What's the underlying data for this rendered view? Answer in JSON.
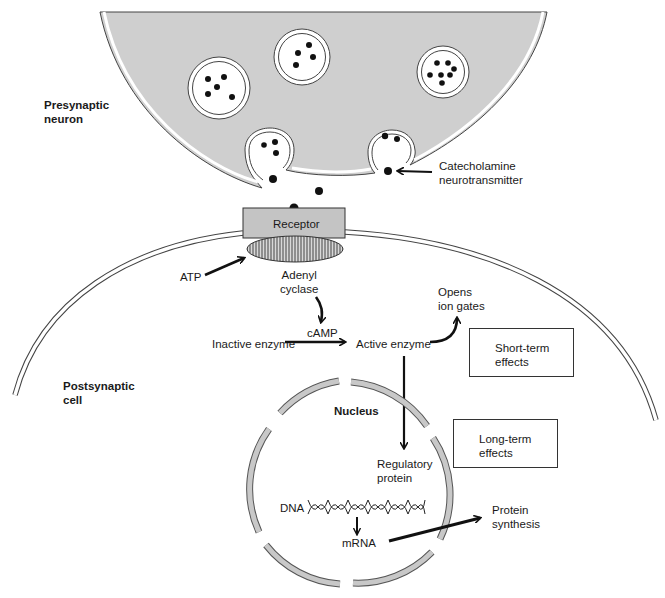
{
  "diagram": {
    "labels": {
      "presynaptic": [
        "Presynaptic",
        "neuron"
      ],
      "postsynaptic": [
        "Postsynaptic",
        "cell"
      ],
      "neurotransmitter": [
        "Catecholamine",
        "neurotransmitter"
      ],
      "receptor": "Receptor",
      "atp": "ATP",
      "adenyl_cyclase": [
        "Adenyl",
        "cyclase"
      ],
      "camp": "cAMP",
      "inactive_enzyme": "Inactive enzyme",
      "active_enzyme": "Active enzyme",
      "opens_ion_gates": [
        "Opens",
        "ion gates"
      ],
      "short_term": [
        "Short-term",
        "effects"
      ],
      "long_term": [
        "Long-term",
        "effects"
      ],
      "nucleus": "Nucleus",
      "regulatory_protein": [
        "Regulatory",
        "protein"
      ],
      "dna": "DNA",
      "mrna": "mRNA",
      "protein_synthesis": [
        "Protein",
        "synthesis"
      ]
    },
    "colors": {
      "cytoplasm": "#cfcfcf",
      "receptor": "#c4c4c4",
      "nucleus_envelope": "#c8c8c8",
      "ink": "#111111",
      "background": "#ffffff"
    }
  }
}
